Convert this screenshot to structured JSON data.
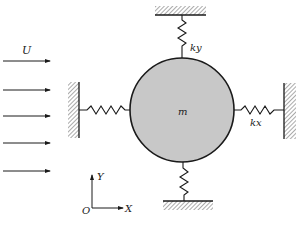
{
  "diagram": {
    "type": "spring-mass system in uniform flow",
    "labels": {
      "flow_velocity": "U",
      "mass": "m",
      "stiffness_y": "ky",
      "stiffness_x": "kx",
      "axis_y": "Y",
      "axis_x": "X",
      "origin": "O"
    },
    "flow_arrows": {
      "count": 5,
      "direction": "right"
    },
    "mass_body": {
      "shape": "circle",
      "fill": "#c8c8c8",
      "stroke": "#1a1a1a"
    },
    "springs": [
      {
        "id": "top",
        "label": "ky",
        "anchor": "top-wall"
      },
      {
        "id": "bottom",
        "label": "",
        "anchor": "bottom-wall"
      },
      {
        "id": "left",
        "label": "",
        "anchor": "left-wall"
      },
      {
        "id": "right",
        "label": "kx",
        "anchor": "right-wall"
      }
    ],
    "colors": {
      "line": "#1a1a1a",
      "body_fill": "#c8c8c8",
      "background": "#ffffff"
    }
  }
}
